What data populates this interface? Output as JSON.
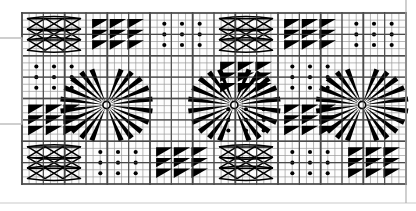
{
  "document": {
    "title": "Embroidery Pattern Chart",
    "description": "Black-and-white needlework charting diagram on graph paper showing a repeating band of motifs",
    "background_color": "#ffffff",
    "ink_color": "#000000",
    "grid_line_color": "#9a9a9a",
    "grid_major_color": "#4a4a4a",
    "paper_color": "#fdfdfd"
  },
  "canvas": {
    "width": 416,
    "height": 211
  },
  "chart_area": {
    "left": 22,
    "top": 13,
    "right": 406,
    "bottom": 184,
    "columns": 18,
    "rows": 8,
    "cell_size": 21.3,
    "minor_divisions": 3
  },
  "left_margin_box": {
    "name": "margin-rule-box",
    "x": -14,
    "y": 38,
    "width": 36,
    "height": 86,
    "stroke": "#b5b5b5"
  },
  "bottom_rule": {
    "y": 203,
    "stroke": "#c9c9c9"
  },
  "right_rule": {
    "x": 406,
    "stroke": "#b0b0b0"
  },
  "motifs": {
    "lattice": {
      "label": "lattice",
      "repeat": 3,
      "description": "interlaced open X / chain lattice filling a 3x3 sub-grid"
    },
    "triangles": {
      "label": "triangles",
      "repeat": 3,
      "description": "solid right triangles with hypotenuse running lower-left to upper-right"
    },
    "dots": {
      "label": "dots",
      "repeat": 3,
      "description": "grid of solid round dots, one per sub-cell"
    },
    "starburst": {
      "label": "starburst",
      "spokes": 24,
      "span_cells": 2,
      "description": "radial fan of tapered spikes converging on a small open ring"
    }
  },
  "layout": {
    "description": "Four stacked bands of motif cells with three large starburst medallions straddling the two central bands",
    "rows": [
      {
        "index": 0,
        "cells": [
          "lattice",
          "triangles",
          "dots",
          "lattice",
          "triangles",
          "dots",
          "lattice",
          "triangles",
          "dots",
          "lattice",
          "triangles",
          "dots",
          "lattice",
          "triangles",
          "dots",
          "lattice",
          "triangles",
          "dots"
        ]
      },
      {
        "index": 1,
        "cells": [
          "dots",
          "starburst",
          "starburst",
          "triangles",
          "dots",
          "starburst",
          "starburst",
          "triangles",
          "dots",
          "starburst",
          "starburst",
          "triangles",
          "dots",
          "starburst",
          "starburst",
          "triangles",
          "dots",
          "lattice"
        ]
      },
      {
        "index": 2,
        "cells": [
          "triangles",
          "starburst",
          "starburst",
          "dots",
          "triangles",
          "starburst",
          "starburst",
          "dots",
          "triangles",
          "starburst",
          "starburst",
          "dots",
          "triangles",
          "starburst",
          "starburst",
          "dots",
          "triangles",
          "dots"
        ]
      },
      {
        "index": 3,
        "cells": [
          "lattice",
          "dots",
          "triangles",
          "lattice",
          "dots",
          "triangles",
          "lattice",
          "dots",
          "triangles",
          "lattice",
          "dots",
          "triangles",
          "lattice",
          "dots",
          "triangles",
          "lattice",
          "dots",
          "lattice"
        ]
      }
    ],
    "starburst_centers": [
      {
        "x": 106.5,
        "y": 105
      },
      {
        "x": 234.3,
        "y": 105
      },
      {
        "x": 362.1,
        "y": 105
      }
    ],
    "starburst_radius": 43
  }
}
